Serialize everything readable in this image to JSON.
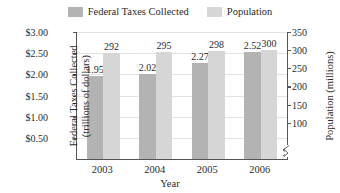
{
  "chart_data": {
    "type": "bar",
    "title": "",
    "categories": [
      "2003",
      "2004",
      "2005",
      "2006"
    ],
    "series": [
      {
        "name": "Federal Taxes Collected",
        "axis": "left",
        "color": "#b3b3b3",
        "values": [
          1.95,
          2.02,
          2.27,
          2.52
        ],
        "labels": [
          "1.95",
          "2.02",
          "2.27",
          "2.52"
        ]
      },
      {
        "name": "Population",
        "axis": "right",
        "color": "#d6d6d6",
        "values": [
          292,
          295,
          298,
          300
        ],
        "labels": [
          "292",
          "295",
          "298",
          "300"
        ]
      }
    ],
    "xlabel": "Year",
    "ylabel": "Federal Taxes Collected (trillions of dollars)",
    "y2label": "Population (millions)",
    "yticks": [
      "$0.50",
      "$1.00",
      "$1.50",
      "$2.00",
      "$2.50",
      "$3.00"
    ],
    "ytick_values": [
      0.5,
      1.0,
      1.5,
      2.0,
      2.5,
      3.0
    ],
    "ylim": [
      0,
      3.0
    ],
    "y2ticks": [
      "100",
      "150",
      "200",
      "250",
      "300",
      "350"
    ],
    "y2tick_values": [
      100,
      150,
      200,
      250,
      300,
      350
    ],
    "y2lim": [
      0,
      350
    ],
    "grid": true,
    "legend_position": "top",
    "axis_break_right": true
  },
  "legend": {
    "entries": [
      {
        "label": "Federal Taxes Collected",
        "color": "#b3b3b3"
      },
      {
        "label": "Population",
        "color": "#d6d6d6"
      }
    ]
  },
  "axes": {
    "left_title_line1": "Federal Taxes Collected",
    "left_title_line2": "(trillions of dollars)",
    "right_title": "Population (millions)",
    "x_title": "Year"
  },
  "colors": {
    "taxes_bar": "#b3b3b3",
    "population_bar": "#d6d6d6",
    "axis": "#555555",
    "grid": "#e2e2e2",
    "text": "#2b2b2b",
    "background": "#ffffff"
  }
}
